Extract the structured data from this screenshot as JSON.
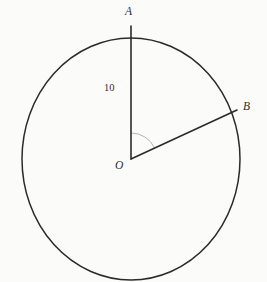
{
  "figure": {
    "kind": "circle-with-two-radii",
    "background_color": "#fbfbfa",
    "stroke_color": "#2b2b2b",
    "arc_color": "#b9b4ae",
    "circle": {
      "center_x": 131,
      "center_y": 159,
      "radius_x": 109,
      "radius_y": 121,
      "stroke_width": 1.5
    },
    "points": {
      "center": {
        "label": "O",
        "x": 131,
        "y": 159
      },
      "top": {
        "label": "A",
        "x": 131,
        "y": 38
      },
      "right": {
        "label": "B",
        "x": 236,
        "y": 110
      }
    },
    "segments": [
      {
        "name": "radius-OA",
        "from": "O",
        "to": "A",
        "x1": 131,
        "y1": 159,
        "x2": 131,
        "y2": 26,
        "length_label": "10"
      },
      {
        "name": "radius-OB",
        "from": "O",
        "to": "B",
        "x1": 131,
        "y1": 159,
        "x2": 237,
        "y2": 110
      }
    ],
    "angle_arc": {
      "name": "angle-AOB",
      "radius": 26,
      "start_angle_deg": 90,
      "end_angle_deg": 25
    },
    "labels": {
      "point_a": "A",
      "point_b": "B",
      "point_o": "O",
      "radius_measure": "10"
    }
  }
}
